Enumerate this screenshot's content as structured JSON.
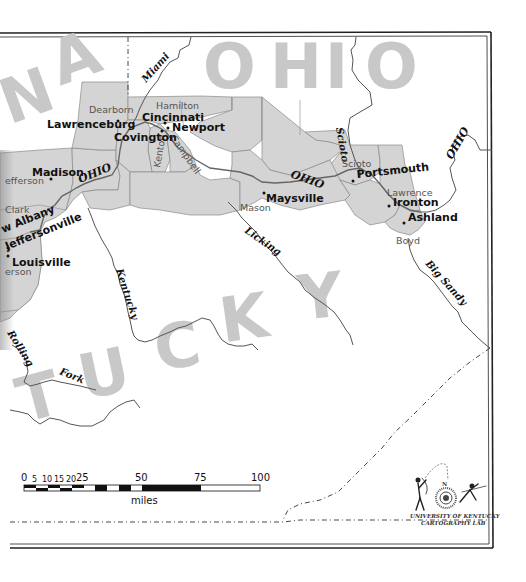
{
  "map": {
    "title": "Ohio River region: Indiana, Ohio, Kentucky",
    "state_labels": {
      "indiana_partial": "NA",
      "ohio": "OHIO",
      "kentucky_partial": "TUCKY"
    },
    "state_label_letters": {
      "indiana": [
        "N",
        "A"
      ],
      "ohio": [
        "O",
        "H",
        "I",
        "O"
      ],
      "kentucky": [
        "T",
        "U",
        "C",
        "K",
        "Y"
      ]
    },
    "cities": [
      {
        "name": "Lawrenceburg",
        "state": "Indiana"
      },
      {
        "name": "Cincinnati",
        "state": "Ohio"
      },
      {
        "name": "Newport",
        "state": "Kentucky"
      },
      {
        "name": "Covington",
        "state": "Kentucky"
      },
      {
        "name": "Madison",
        "state": "Indiana"
      },
      {
        "name": "New Albany",
        "display": "w Albany",
        "state": "Indiana"
      },
      {
        "name": "Jeffersonville",
        "display": "Jeffersonville",
        "state": "Indiana"
      },
      {
        "name": "Louisville",
        "state": "Kentucky"
      },
      {
        "name": "Maysville",
        "state": "Kentucky"
      },
      {
        "name": "Portsmouth",
        "state": "Ohio"
      },
      {
        "name": "Ironton",
        "state": "Ohio"
      },
      {
        "name": "Ashland",
        "state": "Kentucky"
      }
    ],
    "counties": [
      {
        "name": "Dearborn"
      },
      {
        "name": "Hamilton"
      },
      {
        "name": "Kenton"
      },
      {
        "name": "Campbell"
      },
      {
        "name": "Jefferson",
        "display": "efferson"
      },
      {
        "name": "Clark",
        "display": "Clark"
      },
      {
        "name": "Jefferson (KY)",
        "display": "erson"
      },
      {
        "name": "Mason"
      },
      {
        "name": "Scioto"
      },
      {
        "name": "Lawrence"
      },
      {
        "name": "Boyd"
      }
    ],
    "rivers": [
      {
        "name": "Miami"
      },
      {
        "name": "Ohio",
        "display": "OHIO"
      },
      {
        "name": "Scioto"
      },
      {
        "name": "Licking"
      },
      {
        "name": "Kentucky"
      },
      {
        "name": "Big Sandy"
      },
      {
        "name": "Rolling Fork",
        "display_parts": [
          "Rolling",
          "Fork"
        ]
      }
    ],
    "scale_bar": {
      "unit": "miles",
      "ticks": [
        "0",
        "5",
        "10",
        "15",
        "20",
        "25",
        "50",
        "75",
        "100"
      ]
    },
    "credit": {
      "line1": "UNIVERSITY OF KENTUCKY",
      "line2": "CARTOGRAPHY LAB",
      "compass_letter": "N"
    }
  },
  "labels": {
    "city": {
      "lawrenceburg": "Lawrenceburg",
      "cincinnati": "Cincinnati",
      "newport": "Newport",
      "covington": "Covington",
      "madison": "Madison",
      "new_albany": "w Albany",
      "jeffersonville": "Jeffersonville",
      "louisville": "Louisville",
      "maysville": "Maysville",
      "portsmouth": "Portsmouth",
      "ironton": "Ironton",
      "ashland": "Ashland"
    },
    "county": {
      "dearborn": "Dearborn",
      "hamilton": "Hamilton",
      "kenton": "Kenton",
      "campbell": "Campbell",
      "jefferson_in": "efferson",
      "clark": "Clark",
      "jefferson_ky": "erson",
      "mason": "Mason",
      "scioto": "Scioto",
      "lawrence": "Lawrence",
      "boyd": "Boyd"
    },
    "river": {
      "miami": "Miami",
      "ohio1": "OHIO",
      "ohio2": "OHIO",
      "ohio3": "OHIO",
      "scioto": "Scioto",
      "licking": "Licking",
      "kentucky": "Kentucky",
      "big_sandy": "Big Sandy",
      "rolling": "Rolling",
      "fork": "Fork"
    },
    "state": {
      "n": "N",
      "a": "A",
      "o1": "O",
      "h": "H",
      "i": "I",
      "o2": "O",
      "t": "T",
      "u": "U",
      "c": "C",
      "k": "K",
      "y": "Y"
    },
    "scale": {
      "t0": "0",
      "t5": "5",
      "t10": "10",
      "t15": "15",
      "t20": "20",
      "t25": "25",
      "t50": "50",
      "t75": "75",
      "t100": "100",
      "unit": "miles"
    },
    "credit": {
      "line1": "UNIVERSITY OF KENTUCKY",
      "line2": "CARTOGRAPHY LAB",
      "compass_n": "N"
    }
  }
}
